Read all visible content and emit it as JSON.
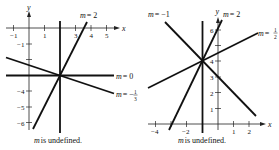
{
  "left_graph": {
    "axis_x_label": "x",
    "axis_y_label": "y",
    "x_ticks": [
      {
        "v": -1,
        "label": "−1"
      },
      {
        "v": 1,
        "label": "1"
      },
      {
        "v": 3,
        "label": "3"
      },
      {
        "v": 4,
        "label": "4"
      },
      {
        "v": 5,
        "label": "5"
      }
    ],
    "y_ticks": [
      {
        "v": -1,
        "label": "−1"
      },
      {
        "v": -4,
        "label": "−4"
      },
      {
        "v": -5,
        "label": "−5"
      },
      {
        "v": -6,
        "label": "−6"
      }
    ],
    "intersection": [
      2,
      -3
    ],
    "lines": [
      {
        "slope": "2",
        "label": "m = 2"
      },
      {
        "slope": "0",
        "label": "m = 0"
      },
      {
        "slope": "-1/3",
        "label_prefix": "m = −",
        "label_num": "1",
        "label_den": "3"
      },
      {
        "slope": "undefined",
        "label": "m is undefined."
      }
    ]
  },
  "right_graph": {
    "axis_x_label": "x",
    "axis_y_label": "y",
    "x_ticks": [
      {
        "v": -4,
        "label": "−4"
      },
      {
        "v": -2,
        "label": "−2"
      },
      {
        "v": 1,
        "label": "1"
      },
      {
        "v": 2,
        "label": "2"
      }
    ],
    "y_ticks": [
      {
        "v": 1,
        "label": "1"
      },
      {
        "v": 2,
        "label": "2"
      },
      {
        "v": 3,
        "label": "3"
      },
      {
        "v": 4,
        "label": "4"
      },
      {
        "v": 6,
        "label": "6"
      }
    ],
    "intersection": [
      -1,
      4
    ],
    "lines": [
      {
        "slope": "-1",
        "label": "m = −1"
      },
      {
        "slope": "2",
        "label": "m = 2"
      },
      {
        "slope": "1/2",
        "label_prefix": "m = ",
        "label_num": "1",
        "label_den": "2"
      },
      {
        "slope": "undefined",
        "label": "m is undefined."
      }
    ]
  }
}
